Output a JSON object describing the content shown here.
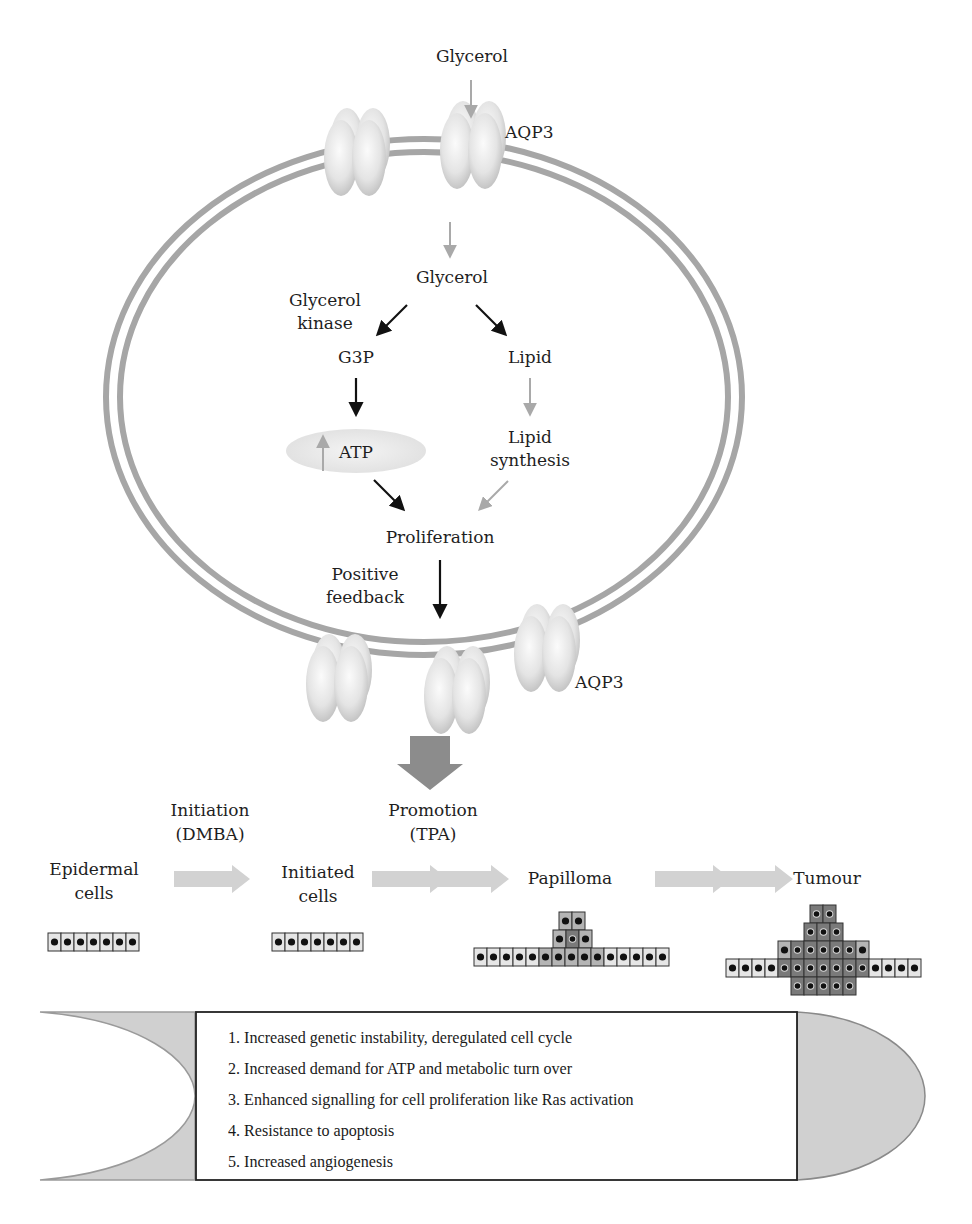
{
  "diagram": {
    "top_label": "Glycerol",
    "aqp3_top": "AQP3",
    "aqp3_bottom": "AQP3",
    "intracellular_glycerol": "Glycerol",
    "glycerol_kinase_line1": "Glycerol",
    "glycerol_kinase_line2": "kinase",
    "g3p": "G3P",
    "lipid": "Lipid",
    "atp": "ATP",
    "lipid_synthesis_line1": "Lipid",
    "lipid_synthesis_line2": "synthesis",
    "proliferation": "Proliferation",
    "positive_feedback_line1": "Positive",
    "positive_feedback_line2": "feedback"
  },
  "stages": {
    "initiation_line1": "Initiation",
    "initiation_line2": "(DMBA)",
    "promotion_line1": "Promotion",
    "promotion_line2": "(TPA)",
    "epidermal_line1": "Epidermal",
    "epidermal_line2": "cells",
    "initiated_line1": "Initiated",
    "initiated_line2": "cells",
    "papilloma": "Papilloma",
    "tumour": "Tumour"
  },
  "features": [
    "1. Increased genetic instability, deregulated cell cycle",
    "2. Increased demand for ATP and metabolic turn over",
    "3. Enhanced signalling for cell proliferation like Ras activation",
    "4. Resistance to apoptosis",
    "5. Increased angiogenesis"
  ],
  "colors": {
    "membrane": "#a6a6a6",
    "channel": "#e2e2e2",
    "black_arrow": "#111111",
    "grey_arrow": "#a9a9a9",
    "stage_arrow": "#d2d2d2",
    "block_arrow": "#8c8c8c",
    "cell_light": "#e6e6e6",
    "cell_mid": "#b4b4b4",
    "cell_dark": "#7a7a7a",
    "box_shape": "#d0d0d0"
  }
}
